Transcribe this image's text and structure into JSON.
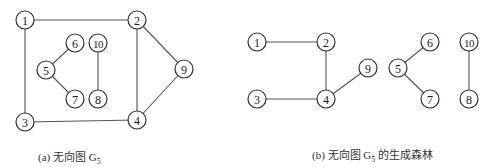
{
  "figures": [
    {
      "id": "a",
      "caption_prefix": "(a) 无向图 G",
      "caption_sub": "5",
      "caption_suffix": "",
      "caption_pos": [
        38,
        148
      ],
      "nodes": [
        {
          "id": "1",
          "x": 25,
          "y": 20
        },
        {
          "id": "2",
          "x": 137,
          "y": 20
        },
        {
          "id": "3",
          "x": 25,
          "y": 122
        },
        {
          "id": "4",
          "x": 137,
          "y": 120
        },
        {
          "id": "5",
          "x": 46,
          "y": 70
        },
        {
          "id": "6",
          "x": 75,
          "y": 43
        },
        {
          "id": "7",
          "x": 75,
          "y": 99
        },
        {
          "id": "8",
          "x": 98,
          "y": 99
        },
        {
          "id": "9",
          "x": 184,
          "y": 69
        },
        {
          "id": "10",
          "x": 98,
          "y": 43
        }
      ],
      "edges": [
        [
          "1",
          "2"
        ],
        [
          "1",
          "3"
        ],
        [
          "3",
          "4"
        ],
        [
          "2",
          "4"
        ],
        [
          "2",
          "9"
        ],
        [
          "4",
          "9"
        ],
        [
          "5",
          "6"
        ],
        [
          "5",
          "7"
        ],
        [
          "10",
          "8"
        ]
      ]
    },
    {
      "id": "b",
      "caption_prefix": "(b) 无向图 G",
      "caption_sub": "5",
      "caption_suffix": " 的生成森林",
      "caption_pos": [
        312,
        146
      ],
      "nodes": [
        {
          "id": "1",
          "x": 257,
          "y": 42
        },
        {
          "id": "2",
          "x": 326,
          "y": 42
        },
        {
          "id": "3",
          "x": 257,
          "y": 99
        },
        {
          "id": "4",
          "x": 326,
          "y": 99
        },
        {
          "id": "9",
          "x": 368,
          "y": 68
        },
        {
          "id": "5",
          "x": 398,
          "y": 68
        },
        {
          "id": "6",
          "x": 430,
          "y": 42
        },
        {
          "id": "7",
          "x": 430,
          "y": 99
        },
        {
          "id": "10",
          "x": 469,
          "y": 42
        },
        {
          "id": "8",
          "x": 469,
          "y": 99
        }
      ],
      "edges": [
        [
          "1",
          "2"
        ],
        [
          "2",
          "4"
        ],
        [
          "3",
          "4"
        ],
        [
          "4",
          "9"
        ],
        [
          "5",
          "6"
        ],
        [
          "5",
          "7"
        ],
        [
          "10",
          "8"
        ]
      ]
    }
  ],
  "node_radius": 9
}
